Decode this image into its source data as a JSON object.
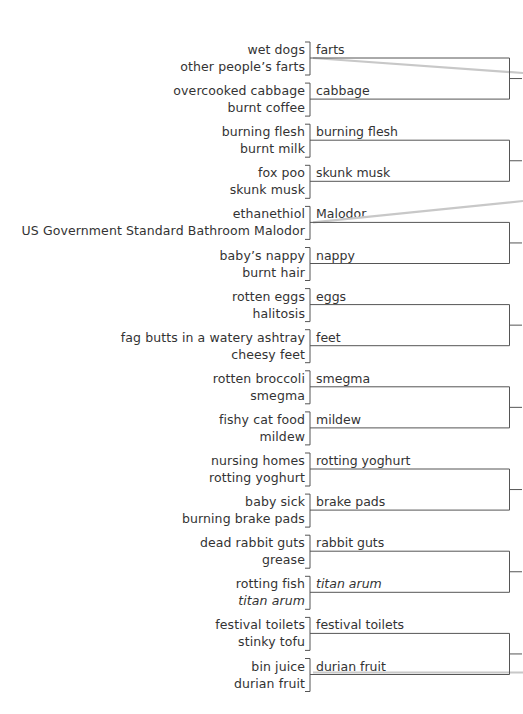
{
  "diagram": {
    "pairs": [
      {
        "a": "wet dogs",
        "b": "other people’s farts",
        "winner": "farts",
        "a_italic": false,
        "b_italic": false,
        "winner_italic": false
      },
      {
        "a": "overcooked cabbage",
        "b": "burnt coffee",
        "winner": "cabbage",
        "a_italic": false,
        "b_italic": false,
        "winner_italic": false
      },
      {
        "a": "burning flesh",
        "b": "burnt milk",
        "winner": "burning flesh",
        "a_italic": false,
        "b_italic": false,
        "winner_italic": false
      },
      {
        "a": "fox poo",
        "b": "skunk musk",
        "winner": "skunk musk",
        "a_italic": false,
        "b_italic": false,
        "winner_italic": false
      },
      {
        "a": "ethanethiol",
        "b": "US Government Standard Bathroom Malodor",
        "winner": "Malodor",
        "a_italic": false,
        "b_italic": false,
        "winner_italic": false
      },
      {
        "a": "baby’s nappy",
        "b": "burnt hair",
        "winner": "nappy",
        "a_italic": false,
        "b_italic": false,
        "winner_italic": false
      },
      {
        "a": "rotten eggs",
        "b": "halitosis",
        "winner": "eggs",
        "a_italic": false,
        "b_italic": false,
        "winner_italic": false
      },
      {
        "a": "fag butts in a watery ashtray",
        "b": "cheesy feet",
        "winner": "feet",
        "a_italic": false,
        "b_italic": false,
        "winner_italic": false
      },
      {
        "a": "rotten broccoli",
        "b": "smegma",
        "winner": "smegma",
        "a_italic": false,
        "b_italic": false,
        "winner_italic": false
      },
      {
        "a": "fishy cat food",
        "b": "mildew",
        "winner": "mildew",
        "a_italic": false,
        "b_italic": false,
        "winner_italic": false
      },
      {
        "a": "nursing homes",
        "b": "rotting yoghurt",
        "winner": "rotting yoghurt",
        "a_italic": false,
        "b_italic": false,
        "winner_italic": false
      },
      {
        "a": "baby sick",
        "b": "burning brake pads",
        "winner": "brake pads",
        "a_italic": false,
        "b_italic": false,
        "winner_italic": false
      },
      {
        "a": "dead rabbit guts",
        "b": "grease",
        "winner": "rabbit guts",
        "a_italic": false,
        "b_italic": false,
        "winner_italic": false
      },
      {
        "a": "rotting fish",
        "b": "titan arum",
        "winner": "titan arum",
        "a_italic": false,
        "b_italic": true,
        "winner_italic": true
      },
      {
        "a": "festival toilets",
        "b": "stinky tofu",
        "winner": "festival toilets",
        "a_italic": false,
        "b_italic": false,
        "winner_italic": false
      },
      {
        "a": "bin juice",
        "b": "durian fruit",
        "winner": "durian fruit",
        "a_italic": false,
        "b_italic": false,
        "winner_italic": false
      }
    ],
    "highlight_lines": [
      {
        "from_pair": 0,
        "note": "gray path from round 1 to off-page"
      },
      {
        "from_pair": 4,
        "note": "gray path from round 1 to off-page"
      },
      {
        "from_pair": 15,
        "note": "gray path continuing off-page"
      }
    ],
    "colors": {
      "text": "#333333",
      "line": "#555555",
      "highlight": "#c8c8c8"
    }
  }
}
